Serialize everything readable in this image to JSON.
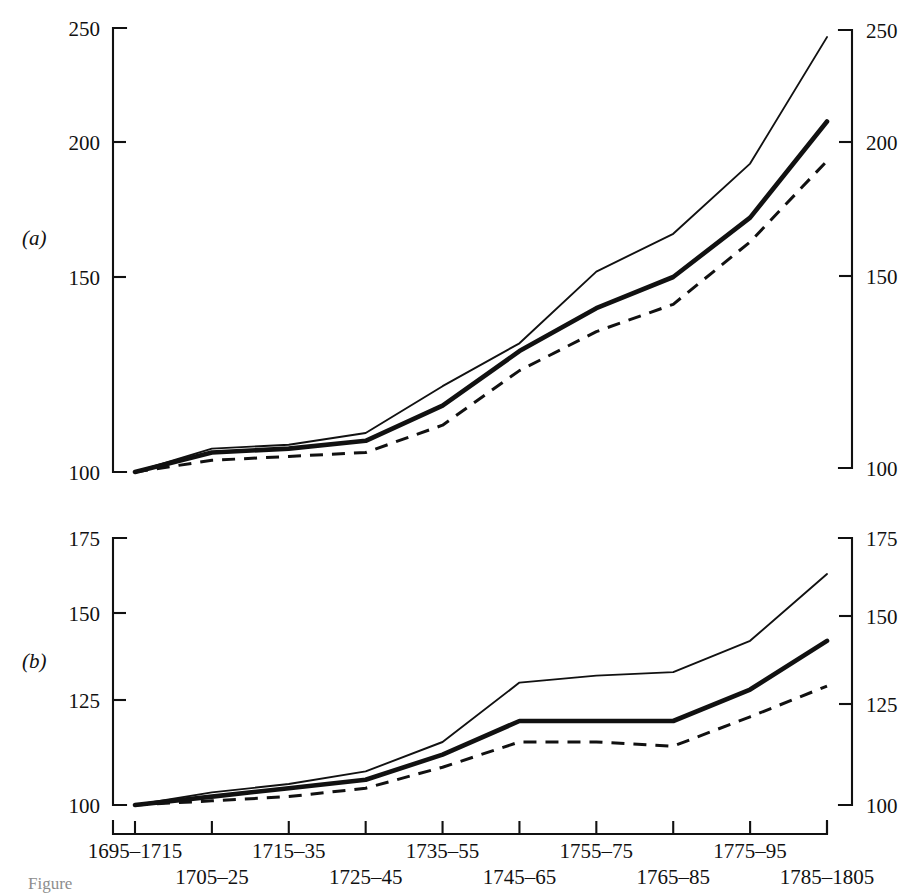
{
  "figure": {
    "panel_a_tag": "(a)",
    "panel_b_tag": "(b)",
    "caption_fragment": "Figure"
  },
  "chart_data": [
    {
      "id": "panel-a",
      "type": "line",
      "title": "(a)",
      "xlabel": "",
      "ylabel": "",
      "grid": false,
      "legend": "none",
      "ylim": [
        100,
        250
      ],
      "ytick_labels_left": [
        "250",
        "200",
        "150",
        "100"
      ],
      "ytick_labels_right": [
        "250",
        "200",
        "150",
        "100"
      ],
      "yticks": [
        250,
        200,
        150,
        100
      ],
      "categories": [
        "1695–1715",
        "1705–25",
        "1715–35",
        "1725–45",
        "1735–55",
        "1745–65",
        "1755–75",
        "1765–85",
        "1775–95",
        "1785–1805"
      ],
      "series": [
        {
          "name": "upper-thin-solid",
          "style": "thin-solid",
          "values": [
            100,
            106,
            107,
            110,
            122,
            133,
            152,
            166,
            192,
            246
          ]
        },
        {
          "name": "middle-thick-solid",
          "style": "thick-solid",
          "values": [
            100,
            105,
            106,
            108,
            117,
            131,
            142,
            150,
            172,
            209
          ]
        },
        {
          "name": "lower-dashed",
          "style": "dashed",
          "values": [
            100,
            103,
            104,
            105,
            112,
            126,
            136,
            143,
            163,
            193
          ]
        }
      ]
    },
    {
      "id": "panel-b",
      "type": "line",
      "title": "(b)",
      "xlabel": "",
      "ylabel": "",
      "grid": false,
      "legend": "none",
      "ylim": [
        100,
        175
      ],
      "ytick_labels_left": [
        "175",
        "150",
        "125",
        "100"
      ],
      "ytick_labels_right": [
        "175",
        "150",
        "125",
        "100"
      ],
      "yticks": [
        175,
        150,
        125,
        100
      ],
      "categories": [
        "1695–1715",
        "1705–25",
        "1715–35",
        "1725–45",
        "1735–55",
        "1745–65",
        "1755–75",
        "1765–85",
        "1775–95",
        "1785–1805"
      ],
      "series": [
        {
          "name": "upper-thin-solid",
          "style": "thin-solid",
          "values": [
            100,
            103,
            105,
            108,
            115,
            130,
            132,
            133,
            142,
            163
          ]
        },
        {
          "name": "middle-thick-solid",
          "style": "thick-solid",
          "values": [
            100,
            102,
            104,
            106,
            112,
            120,
            120,
            120,
            128,
            142
          ]
        },
        {
          "name": "lower-dashed",
          "style": "dashed",
          "values": [
            100,
            101,
            102,
            104,
            109,
            115,
            115,
            114,
            121,
            129
          ]
        }
      ]
    }
  ],
  "xaxis": {
    "tick_labels": [
      "1695–1715",
      "1705–25",
      "1715–35",
      "1725–45",
      "1735–55",
      "1745–65",
      "1755–75",
      "1765–85",
      "1775–95",
      "1785–1805"
    ]
  },
  "colors": {
    "ink": "#111111",
    "background": "#ffffff"
  }
}
